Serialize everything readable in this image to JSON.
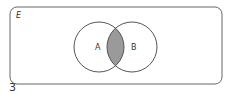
{
  "diagram": {
    "type": "venn",
    "universal_set_label": "E",
    "sets": [
      {
        "label": "A"
      },
      {
        "label": "B"
      }
    ],
    "shaded_region": "A ∩ B",
    "colors": {
      "outline": "#555555",
      "shade": "#9a9a9a",
      "background": "#ffffff"
    }
  },
  "caption_number": "3"
}
